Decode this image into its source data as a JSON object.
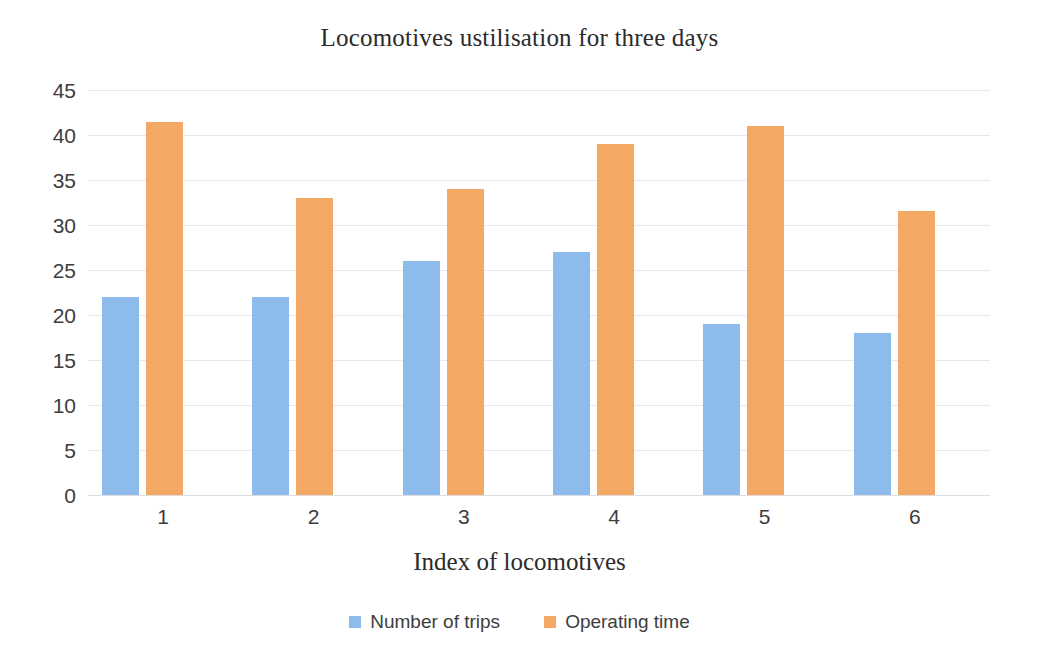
{
  "chart_data": {
    "type": "bar",
    "title": "Locomotives ustilisation for three days",
    "xlabel": "Index of locomotives",
    "ylabel": "",
    "categories": [
      "1",
      "2",
      "3",
      "4",
      "5",
      "6"
    ],
    "series": [
      {
        "name": "Number of trips",
        "color": "#8CBBEC",
        "values": [
          22,
          22,
          26,
          27,
          19,
          18
        ]
      },
      {
        "name": "Operating time",
        "color": "#F3A965",
        "values": [
          41.5,
          33,
          34,
          39,
          41,
          31.6
        ]
      }
    ],
    "ylim": [
      0,
      45
    ],
    "ytick_step": 5,
    "yticks": [
      "45",
      "40",
      "35",
      "30",
      "25",
      "20",
      "15",
      "10",
      "5",
      "0"
    ],
    "grid": true,
    "grid_color": "#e8e8ea",
    "legend_position": "bottom",
    "background": "#ffffff"
  },
  "legend": {
    "items": [
      {
        "label": "Number of trips"
      },
      {
        "label": "Operating time"
      }
    ]
  }
}
